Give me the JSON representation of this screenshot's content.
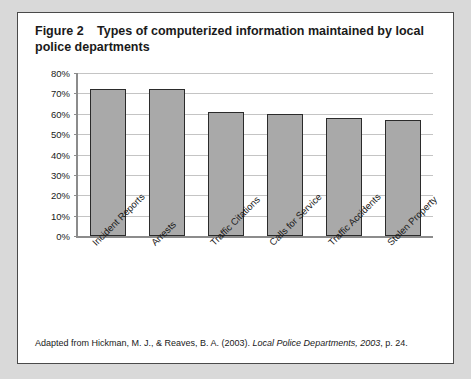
{
  "figure": {
    "label": "Figure 2",
    "title": "Types of computerized information maintained by local police departments",
    "caption_prefix": "Adapted from Hickman, M. J., & Reaves, B. A. (2003). ",
    "caption_italic": "Local Police Departments, 2003",
    "caption_suffix": ", p. 24."
  },
  "chart_data": {
    "type": "bar",
    "title": "Types of computerized information maintained by local police departments",
    "xlabel": "",
    "ylabel": "",
    "categories": [
      "Incident Reports",
      "Arrests",
      "Traffic Citations",
      "Calls for Service",
      "Traffic Accidents",
      "Stolen Property"
    ],
    "values": [
      72,
      72,
      61,
      60,
      58,
      57
    ],
    "ylim": [
      0,
      80
    ],
    "ytick_values": [
      0,
      10,
      20,
      30,
      40,
      50,
      60,
      70,
      80
    ],
    "ytick_labels": [
      "0%",
      "10%",
      "20%",
      "30%",
      "40%",
      "50%",
      "60%",
      "70%",
      "80%"
    ],
    "grid": true,
    "legend": "none",
    "bar_fill": "#a9a9a9",
    "bar_border": "#2b2b2b",
    "gridline_color": "#c4c4c4",
    "axis_color": "#8c8c8c"
  }
}
